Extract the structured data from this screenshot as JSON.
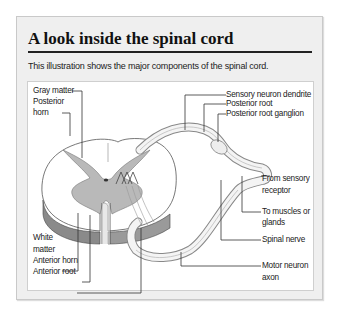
{
  "header": {
    "title": "A look inside the spinal cord",
    "subtitle": "This illustration shows the major components of the spinal cord."
  },
  "diagram": {
    "labels_left": [
      {
        "id": "gray-matter",
        "text": "Gray matter"
      },
      {
        "id": "posterior-horn",
        "line1": "Posterior",
        "line2": "horn"
      },
      {
        "id": "white-matter",
        "line1": "White",
        "line2": "matter"
      },
      {
        "id": "anterior-horn",
        "text": "Anterior horn"
      },
      {
        "id": "anterior-root",
        "text": "Anterior root"
      }
    ],
    "labels_right": [
      {
        "id": "sensory-neuron-dendrite",
        "text": "Sensory neuron dendrite"
      },
      {
        "id": "posterior-root",
        "text": "Posterior root"
      },
      {
        "id": "posterior-root-ganglion",
        "text": "Posterior root ganglion"
      },
      {
        "id": "from-sensory-receptor",
        "line1": "From sensory",
        "line2": "receptor"
      },
      {
        "id": "to-muscles-or-glands",
        "line1": "To muscles or",
        "line2": "glands"
      },
      {
        "id": "spinal-nerve",
        "text": "Spinal nerve"
      },
      {
        "id": "motor-neuron-axon",
        "line1": "Motor neuron",
        "line2": "axon"
      }
    ],
    "colors": {
      "gray_matter": "#b9b9b9",
      "white_matter": "#ffffff",
      "outline": "#555555",
      "background_box": "#efefef"
    }
  }
}
